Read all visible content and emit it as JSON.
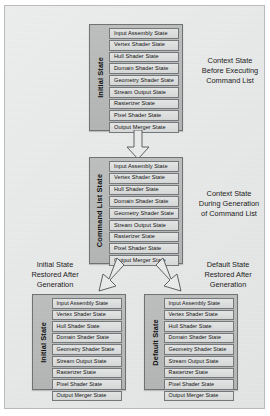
{
  "diagram": {
    "state_items": [
      "Input Assembly State",
      "Vertex Shader State",
      "Hull Shader State",
      "Domain Shader State",
      "Geometry Shader State",
      "Stream Output State",
      "Rasterizer State",
      "Pixel Shader State",
      "Output Merger State"
    ],
    "blocks": {
      "initial_top": {
        "label": "Initial State"
      },
      "command_list": {
        "label": "Command List State"
      },
      "initial_bottom": {
        "label": "Initial State"
      },
      "default_bottom": {
        "label": "Default State"
      }
    },
    "captions": {
      "before_executing": "Context State\nBefore Executing\nCommand List",
      "before_executing_lines": [
        "Context State",
        "Before Executing",
        "Command List"
      ],
      "during_generation_lines": [
        "Context State",
        "During Generation",
        "of Command List"
      ],
      "initial_restored_lines": [
        "Initial State",
        "Restored After",
        "Generation"
      ],
      "default_restored_lines": [
        "Default State",
        "Restored After",
        "Generation"
      ]
    },
    "arrows": {
      "down": "arrow-down",
      "diverge_left": "arrow-down-left",
      "diverge_right": "arrow-down-right"
    },
    "colors": {
      "panel_background": "#e8e9e9",
      "panel_border": "#b9bbbb",
      "block_fill": "#b7b9b9",
      "block_border": "#6f7272",
      "row_fill": "#dedfdf",
      "row_border": "#74787a",
      "text": "#111111",
      "arrow_fill": "#e9eaea",
      "arrow_border": "#5e6162"
    }
  }
}
